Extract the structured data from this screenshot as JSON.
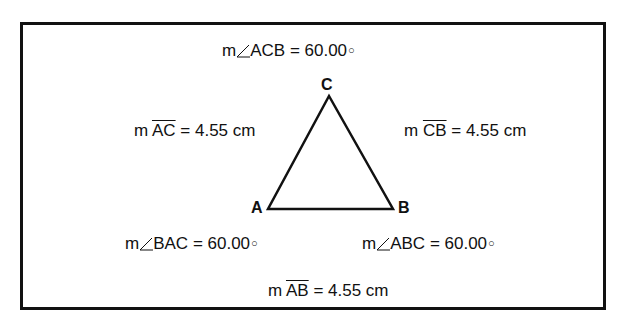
{
  "diagram": {
    "vertices": [
      {
        "name": "A",
        "x": 268,
        "y": 209
      },
      {
        "name": "B",
        "x": 393,
        "y": 209
      },
      {
        "name": "C",
        "x": 329,
        "y": 96
      }
    ],
    "angles": {
      "acb": {
        "prefix": "m",
        "name": "ACB",
        "value": "= 60.00",
        "unit": "°"
      },
      "bac": {
        "prefix": "m",
        "name": "BAC",
        "value": "= 60.00",
        "unit": "°"
      },
      "abc": {
        "prefix": "m",
        "name": "ABC",
        "value": "= 60.00",
        "unit": "°"
      }
    },
    "segments": {
      "ac": {
        "prefix": "m",
        "name": "AC",
        "value": "= 4.55 cm"
      },
      "cb": {
        "prefix": "m",
        "name": "CB",
        "value": "= 4.55 cm"
      },
      "ab": {
        "prefix": "m",
        "name": "AB",
        "value": "= 4.55 cm"
      }
    },
    "colors": {
      "stroke": "#111111",
      "background": "#ffffff"
    }
  }
}
